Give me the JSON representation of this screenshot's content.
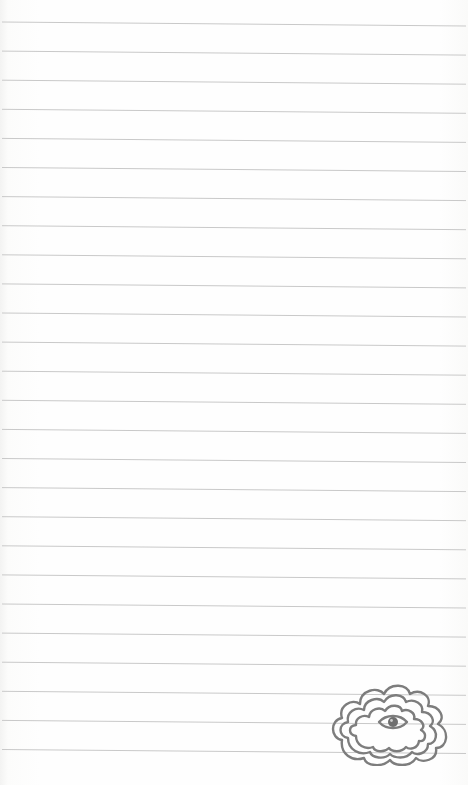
{
  "page": {
    "type": "lined-notepad-paper",
    "background_color": "#fdfdfc",
    "rule_color": "#c9c9c9",
    "rule_count": 26,
    "first_rule_y": 22,
    "rule_spacing": 29.1,
    "rule_slope_px": 4
  },
  "illustration": {
    "icon": "cloud-with-eye-icon",
    "stroke_color": "#7d7d7d",
    "position": "bottom-right"
  }
}
